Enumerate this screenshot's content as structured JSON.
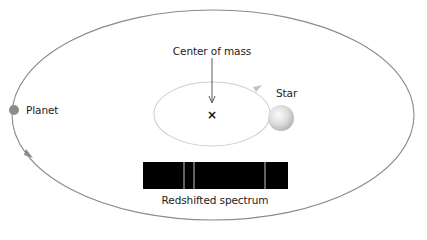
{
  "diagram": {
    "labels": {
      "center_of_mass": "Center of mass",
      "star": "Star",
      "planet": "Planet",
      "spectrum": "Redshifted spectrum"
    },
    "center_of_mass_marker": "×",
    "colors": {
      "background": "#ffffff",
      "planet_orbit": "#8a8a8a",
      "star_orbit": "#cfcfcf",
      "planet": "#8c8c8c",
      "star_light": "#f5f5f5",
      "star_dark": "#b8b8b8",
      "spectrum_background": "#000000",
      "spectrum_lines": "#d9d9d9",
      "text": "#222222"
    },
    "planet_orbit": {
      "cx": 213,
      "cy": 115,
      "rx": 201,
      "ry": 105,
      "direction": "counterclockwise"
    },
    "star_orbit": {
      "cx": 212,
      "cy": 114,
      "rx": 58,
      "ry": 32,
      "direction": "counterclockwise"
    },
    "star": {
      "cx": 281,
      "cy": 118,
      "r": 13
    },
    "planet": {
      "cx": 14,
      "cy": 110,
      "r": 5
    },
    "center_of_mass": {
      "x": 212,
      "y": 115
    },
    "spectrum": {
      "x": 143,
      "y": 162,
      "width": 145,
      "height": 27,
      "line_positions": [
        184,
        194,
        265
      ]
    }
  }
}
